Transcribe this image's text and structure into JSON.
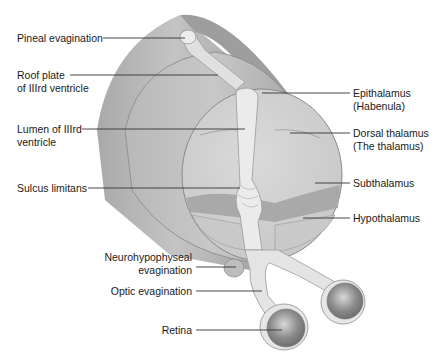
{
  "diagram": {
    "type": "anatomical-illustration",
    "labels_left": [
      {
        "id": "pineal",
        "text": "Pineal evagination"
      },
      {
        "id": "roof",
        "line1": "Roof plate",
        "line2": "of IIIrd ventricle"
      },
      {
        "id": "lumen",
        "line1": "Lumen of IIIrd",
        "line2": "ventricle"
      },
      {
        "id": "sulcus",
        "text": "Sulcus limitans"
      },
      {
        "id": "neuro",
        "line1": "Neurohypophyseal",
        "line2": "evagination"
      },
      {
        "id": "optic",
        "text": "Optic evagination"
      },
      {
        "id": "retina",
        "text": "Retina"
      }
    ],
    "labels_right": [
      {
        "id": "epi",
        "line1": "Epithalamus",
        "line2": "(Habenula)"
      },
      {
        "id": "dorsal",
        "line1": "Dorsal thalamus",
        "line2": "(The thalamus)"
      },
      {
        "id": "sub",
        "text": "Subthalamus"
      },
      {
        "id": "hypo",
        "text": "Hypothalamus"
      }
    ],
    "colors": {
      "outer_tube": "#9a9a9a",
      "tube_mid": "#b4b4b4",
      "cut_face": "#cfcfcf",
      "ventricle": "#e6e6e6",
      "subthalamus_band": "#a8a8a8",
      "retina": "#8a8a8a",
      "leader_line": "#333333"
    }
  }
}
